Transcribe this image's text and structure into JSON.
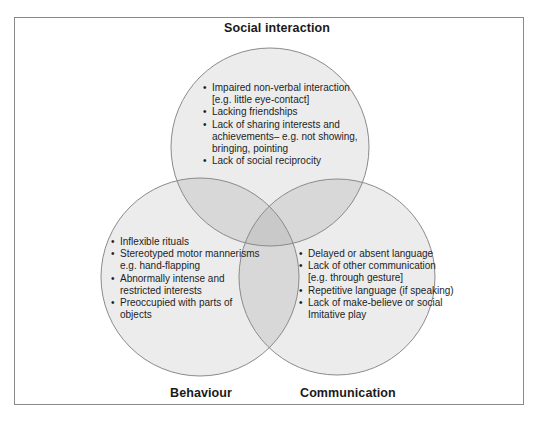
{
  "diagram": {
    "type": "venn",
    "colors": {
      "single": "#ececec",
      "double": "#d8d8d8",
      "triple": "#c9c9c9",
      "stroke": "#8a8a8a",
      "frame": "#8a8a8a"
    },
    "sets": {
      "social": {
        "label": "Social interaction",
        "items": [
          [
            "Impaired non-verbal interaction",
            "[e.g. little eye-contact]"
          ],
          [
            "Lacking friendships"
          ],
          [
            "Lack of sharing interests and",
            "achievements– e.g. not showing,",
            "bringing, pointing"
          ],
          [
            "Lack of social reciprocity"
          ]
        ]
      },
      "behaviour": {
        "label": "Behaviour",
        "items": [
          [
            "Inflexible rituals"
          ],
          [
            "Stereotyped motor mannerisms",
            "e.g. hand-flapping"
          ],
          [
            "Abnormally intense and",
            "restricted interests"
          ],
          [
            "Preoccupied with parts of",
            "objects"
          ]
        ]
      },
      "communication": {
        "label": "Communication",
        "items": [
          [
            "Delayed or absent language"
          ],
          [
            "Lack of other communication",
            "[e.g. through gesture]"
          ],
          [
            "Repetitive language (if speaking)"
          ],
          [
            "Lack of make-believe or social",
            "Imitative play"
          ]
        ]
      }
    }
  }
}
